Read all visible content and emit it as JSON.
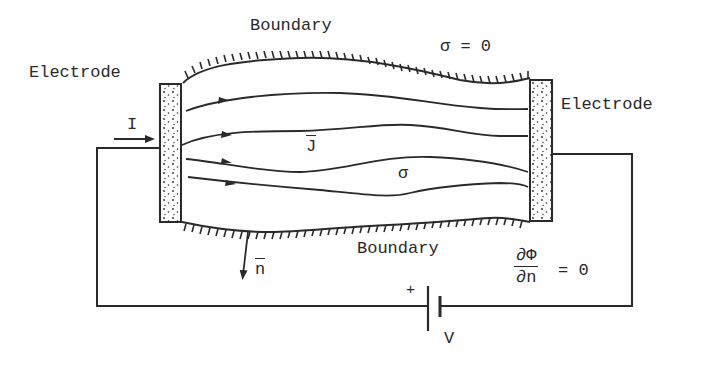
{
  "diagram": {
    "labels": {
      "boundary_top": "Boundary",
      "boundary_bottom": "Boundary",
      "electrode_left": "Electrode",
      "electrode_right": "Electrode",
      "current": "I",
      "current_density": "J",
      "conductivity": "σ",
      "outside_conductivity": "σ = 0",
      "normal_vector": "n",
      "bc_numerator": "∂Φ",
      "bc_denominator": "∂n",
      "bc_equals": "= 0",
      "battery_plus": "+",
      "battery_voltage": "V"
    },
    "elements": {
      "current_lines": 4,
      "electrodes": 2,
      "battery": 1
    },
    "colors": {
      "ink": "#2a2a2a",
      "background": "#ffffff"
    }
  }
}
